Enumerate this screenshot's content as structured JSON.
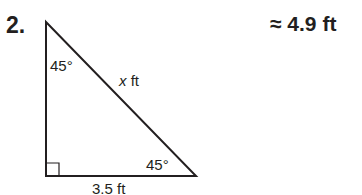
{
  "problem": {
    "number": "2.",
    "answer": "≈ 4.9 ft",
    "figure": {
      "type": "right-triangle",
      "angle_top": "45°",
      "angle_bottom_right": "45°",
      "hypotenuse_var": "x",
      "hypotenuse_unit": " ft",
      "base_label": "3.5 ft",
      "right_angle_marker": "bottom-left"
    }
  }
}
